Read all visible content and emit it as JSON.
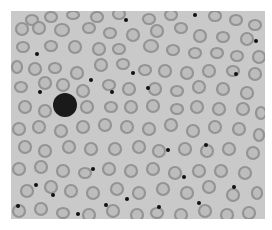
{
  "image": {
    "subject": "blood smear micrograph",
    "background_color": "#c9c9c9",
    "cell_ring_color": "#8f8f8f",
    "cell_center_color": "#bcbcbc",
    "dot_color": "#111111",
    "lymphocyte_color": "#1a1a1a"
  },
  "lymphocyte": {
    "cx": 54,
    "cy": 94,
    "r": 12
  },
  "dots": [
    [
      115,
      9
    ],
    [
      184,
      4
    ],
    [
      245,
      30
    ],
    [
      26,
      43
    ],
    [
      80,
      69
    ],
    [
      122,
      62
    ],
    [
      137,
      77
    ],
    [
      29,
      81
    ],
    [
      101,
      81
    ],
    [
      225,
      63
    ],
    [
      25,
      174
    ],
    [
      42,
      184
    ],
    [
      82,
      158
    ],
    [
      116,
      188
    ],
    [
      157,
      139
    ],
    [
      119,
      214
    ],
    [
      195,
      134
    ],
    [
      7,
      195
    ],
    [
      67,
      203
    ],
    [
      223,
      176
    ],
    [
      148,
      196
    ],
    [
      173,
      166
    ],
    [
      188,
      192
    ],
    [
      95,
      194
    ]
  ],
  "cells": [
    [
      21,
      9,
      7,
      6
    ],
    [
      40,
      6,
      7,
      6
    ],
    [
      62,
      4,
      7,
      5
    ],
    [
      86,
      6,
      7,
      6
    ],
    [
      108,
      3,
      7,
      6
    ],
    [
      138,
      8,
      7,
      6
    ],
    [
      160,
      4,
      7,
      6
    ],
    [
      204,
      5,
      7,
      6
    ],
    [
      225,
      9,
      7,
      6
    ],
    [
      244,
      14,
      7,
      6
    ],
    [
      11,
      18,
      7,
      7
    ],
    [
      28,
      17,
      7,
      7
    ],
    [
      51,
      19,
      8,
      7
    ],
    [
      78,
      17,
      7,
      6
    ],
    [
      99,
      22,
      7,
      6
    ],
    [
      122,
      24,
      7,
      7
    ],
    [
      146,
      20,
      7,
      7
    ],
    [
      170,
      17,
      7,
      6
    ],
    [
      189,
      25,
      7,
      7
    ],
    [
      212,
      26,
      7,
      6
    ],
    [
      236,
      28,
      7,
      7
    ],
    [
      12,
      36,
      7,
      6
    ],
    [
      40,
      35,
      7,
      6
    ],
    [
      64,
      36,
      7,
      7
    ],
    [
      88,
      38,
      7,
      7
    ],
    [
      108,
      38,
      7,
      6
    ],
    [
      140,
      35,
      8,
      7
    ],
    [
      162,
      39,
      7,
      6
    ],
    [
      184,
      42,
      7,
      6
    ],
    [
      206,
      42,
      7,
      6
    ],
    [
      226,
      45,
      7,
      6
    ],
    [
      248,
      46,
      7,
      7
    ],
    [
      6,
      56,
      6,
      7
    ],
    [
      24,
      58,
      7,
      7
    ],
    [
      44,
      57,
      7,
      6
    ],
    [
      66,
      62,
      7,
      7
    ],
    [
      90,
      54,
      7,
      7
    ],
    [
      112,
      53,
      7,
      6
    ],
    [
      134,
      59,
      7,
      6
    ],
    [
      154,
      60,
      7,
      7
    ],
    [
      176,
      62,
      7,
      7
    ],
    [
      198,
      60,
      7,
      7
    ],
    [
      222,
      60,
      7,
      6
    ],
    [
      244,
      63,
      7,
      7
    ],
    [
      10,
      76,
      7,
      6
    ],
    [
      34,
      72,
      7,
      7
    ],
    [
      52,
      74,
      7,
      7
    ],
    [
      72,
      80,
      7,
      7
    ],
    [
      98,
      74,
      7,
      6
    ],
    [
      118,
      78,
      7,
      7
    ],
    [
      144,
      78,
      7,
      7
    ],
    [
      166,
      80,
      7,
      6
    ],
    [
      188,
      76,
      7,
      7
    ],
    [
      212,
      78,
      7,
      7
    ],
    [
      236,
      82,
      7,
      7
    ],
    [
      14,
      96,
      7,
      7
    ],
    [
      34,
      100,
      7,
      7
    ],
    [
      76,
      96,
      7,
      7
    ],
    [
      100,
      96,
      7,
      6
    ],
    [
      120,
      96,
      7,
      7
    ],
    [
      142,
      95,
      7,
      7
    ],
    [
      166,
      98,
      7,
      6
    ],
    [
      186,
      96,
      7,
      7
    ],
    [
      208,
      98,
      7,
      7
    ],
    [
      232,
      98,
      7,
      7
    ],
    [
      250,
      102,
      6,
      7
    ],
    [
      8,
      118,
      7,
      7
    ],
    [
      28,
      116,
      7,
      7
    ],
    [
      50,
      120,
      7,
      7
    ],
    [
      72,
      116,
      7,
      7
    ],
    [
      94,
      114,
      7,
      7
    ],
    [
      116,
      116,
      7,
      7
    ],
    [
      138,
      118,
      7,
      7
    ],
    [
      160,
      114,
      7,
      7
    ],
    [
      182,
      120,
      7,
      7
    ],
    [
      204,
      116,
      7,
      7
    ],
    [
      228,
      118,
      7,
      7
    ],
    [
      248,
      124,
      6,
      7
    ],
    [
      14,
      136,
      7,
      7
    ],
    [
      34,
      140,
      7,
      7
    ],
    [
      58,
      136,
      7,
      7
    ],
    [
      80,
      138,
      7,
      7
    ],
    [
      104,
      138,
      7,
      7
    ],
    [
      128,
      136,
      7,
      7
    ],
    [
      148,
      140,
      7,
      7
    ],
    [
      174,
      138,
      7,
      7
    ],
    [
      196,
      140,
      7,
      7
    ],
    [
      218,
      138,
      7,
      7
    ],
    [
      242,
      142,
      7,
      7
    ],
    [
      8,
      158,
      7,
      7
    ],
    [
      30,
      156,
      7,
      7
    ],
    [
      52,
      160,
      7,
      7
    ],
    [
      74,
      162,
      7,
      6
    ],
    [
      98,
      158,
      7,
      7
    ],
    [
      120,
      160,
      7,
      7
    ],
    [
      142,
      158,
      7,
      7
    ],
    [
      164,
      162,
      7,
      7
    ],
    [
      188,
      160,
      7,
      7
    ],
    [
      210,
      160,
      7,
      7
    ],
    [
      234,
      162,
      7,
      7
    ],
    [
      16,
      180,
      7,
      7
    ],
    [
      40,
      176,
      7,
      7
    ],
    [
      60,
      180,
      7,
      7
    ],
    [
      82,
      182,
      7,
      7
    ],
    [
      106,
      178,
      7,
      7
    ],
    [
      128,
      182,
      7,
      7
    ],
    [
      152,
      178,
      7,
      7
    ],
    [
      176,
      182,
      7,
      7
    ],
    [
      198,
      176,
      7,
      7
    ],
    [
      222,
      184,
      7,
      7
    ],
    [
      246,
      182,
      6,
      7
    ],
    [
      8,
      200,
      7,
      7
    ],
    [
      30,
      198,
      7,
      7
    ],
    [
      52,
      202,
      7,
      6
    ],
    [
      78,
      204,
      7,
      7
    ],
    [
      102,
      200,
      7,
      7
    ],
    [
      126,
      204,
      7,
      7
    ],
    [
      146,
      202,
      7,
      6
    ],
    [
      170,
      204,
      7,
      7
    ],
    [
      194,
      200,
      7,
      7
    ],
    [
      216,
      204,
      7,
      7
    ],
    [
      238,
      202,
      7,
      7
    ]
  ]
}
